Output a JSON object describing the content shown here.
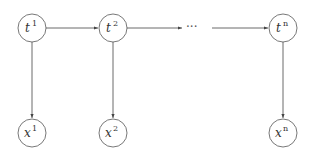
{
  "diagram": {
    "nodes": [
      {
        "id": "t1",
        "base": "t",
        "sup": "1",
        "row": "latent"
      },
      {
        "id": "t2",
        "base": "t",
        "sup": "2",
        "row": "latent"
      },
      {
        "id": "tn",
        "base": "t",
        "sup": "n",
        "row": "latent"
      },
      {
        "id": "x1",
        "base": "x",
        "sup": "1",
        "row": "observed"
      },
      {
        "id": "x2",
        "base": "x",
        "sup": "2",
        "row": "observed"
      },
      {
        "id": "xn",
        "base": "x",
        "sup": "n",
        "row": "observed"
      }
    ],
    "ellipsis": "···",
    "edges": [
      {
        "from": "t1",
        "to": "t2"
      },
      {
        "from": "t2",
        "to": "ellipsis"
      },
      {
        "from": "ellipsis",
        "to": "tn"
      },
      {
        "from": "t1",
        "to": "x1"
      },
      {
        "from": "t2",
        "to": "x2"
      },
      {
        "from": "tn",
        "to": "xn"
      }
    ]
  }
}
